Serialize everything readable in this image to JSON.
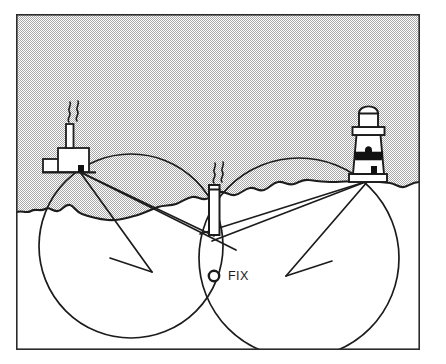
{
  "figure": {
    "type": "nautical-navigation-diagram",
    "frame": {
      "x": 16,
      "y": 14,
      "width": 404,
      "height": 336,
      "border_color": "#2b2b2b",
      "border_width": 1.6
    },
    "colors": {
      "ink": "#1c1c1c",
      "sky_fill": "#d8d8d8",
      "land_fill": "#ffffff",
      "lighthouse_band": "#111111",
      "paper": "#ffffff"
    },
    "sky": {
      "label": "dithered gray sky",
      "fill": "#d8d8d8",
      "dither": true
    }
  },
  "labels": {
    "fix": "FIX"
  },
  "landmarks": [
    {
      "id": "factory",
      "name": "factory-with-chimney",
      "x": 80,
      "y": 172,
      "description": "Shoreside factory building with tall smokestack and smoke plume"
    },
    {
      "id": "chimney",
      "name": "central-smokestack",
      "x": 215,
      "y": 232,
      "description": "Prominent isolated chimney on the shoreline, centre object"
    },
    {
      "id": "lighthouse",
      "name": "lighthouse",
      "x": 368,
      "y": 181,
      "description": "Banded lighthouse with domed lantern and gallery"
    }
  ],
  "fix_point": {
    "name": "fix",
    "x": 214,
    "y": 276,
    "marker": "open-circle",
    "radius": 5.2,
    "label": "FIX",
    "label_x": 228,
    "label_y": 280
  },
  "position_circles": [
    {
      "id": "left-circle",
      "name": "position-circle-factory-chimney",
      "cx": 131,
      "cy": 246,
      "r": 92,
      "through": [
        "factory",
        "chimney",
        "fix"
      ]
    },
    {
      "id": "right-circle",
      "name": "position-circle-chimney-lighthouse",
      "cx": 299,
      "cy": 258,
      "r": 100,
      "through": [
        "chimney",
        "lighthouse",
        "fix"
      ]
    }
  ],
  "bearing_lines": [
    {
      "id": "b1",
      "name": "bearing-factory-to-fix-area",
      "x1": 80,
      "y1": 172,
      "x2": 234,
      "y2": 251
    },
    {
      "id": "b2",
      "name": "bearing-factory-chord",
      "x1": 80,
      "y1": 172,
      "x2": 214,
      "y2": 235
    },
    {
      "id": "b3",
      "name": "bearing-factory-diagonal",
      "x1": 80,
      "y1": 172,
      "x2": 148,
      "y2": 272
    },
    {
      "id": "b4",
      "name": "bearing-lighthouse-to-fix",
      "x1": 368,
      "y1": 181,
      "x2": 205,
      "y2": 236
    },
    {
      "id": "b5",
      "name": "bearing-lighthouse-chord",
      "x1": 368,
      "y1": 181,
      "x2": 216,
      "y2": 240
    },
    {
      "id": "b6",
      "name": "bearing-lighthouse-diagonal",
      "x1": 368,
      "y1": 181,
      "x2": 288,
      "y2": 275
    },
    {
      "id": "b7",
      "name": "cross-bearing-left",
      "x1": 110,
      "y1": 258,
      "x2": 152,
      "y2": 272
    },
    {
      "id": "b8",
      "name": "cross-bearing-right",
      "x1": 288,
      "y1": 275,
      "x2": 330,
      "y2": 262
    }
  ],
  "coastline": {
    "name": "shoreline",
    "description": "Irregular coastline running across the figure separating gray sky/sea from white land"
  }
}
